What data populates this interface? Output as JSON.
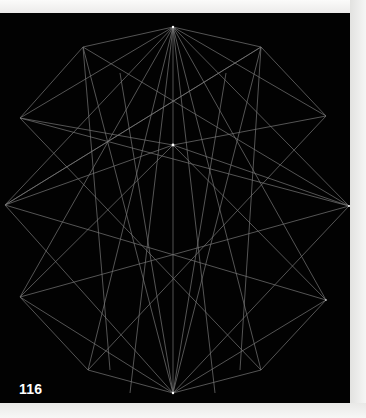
{
  "page": {
    "number": "116",
    "background_color": "#020202",
    "paper_color": "#f4f4f2",
    "line_color": "#8c8c8c"
  },
  "illustration": {
    "description": "geometric line drawing of overlapping star polygons radiating from a top apex and a central hub",
    "vertices": {
      "top_apex": [
        173,
        14
      ],
      "center_hub": [
        173,
        132
      ],
      "bottom_apex": [
        173,
        380
      ],
      "upper_left": [
        83,
        34
      ],
      "upper_right": [
        261,
        34
      ],
      "left_top": [
        20,
        105
      ],
      "right_top": [
        326,
        103
      ],
      "far_left": [
        5,
        192
      ],
      "far_right": [
        349,
        193
      ],
      "lower_left": [
        20,
        284
      ],
      "lower_right": [
        326,
        287
      ],
      "bottom_left": [
        88,
        357
      ],
      "bottom_right": [
        261,
        357
      ]
    }
  }
}
